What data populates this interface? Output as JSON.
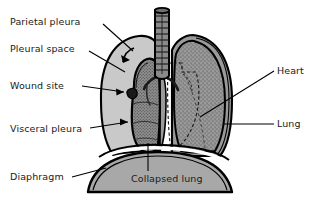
{
  "labels": {
    "parietal_pleura": "Parietal pleura",
    "pleural_space": "Pleural space",
    "wound_site": "Wound site",
    "visceral_pleura": "Visceral pleura",
    "diaphragm": "Diaphragm",
    "heart": "Heart",
    "lung": "Lung",
    "collapsed_lung": "Collapsed lung"
  },
  "colors": {
    "background": "#ffffff",
    "outline": "#000000",
    "pleural_space_fill": "#c9c9c9",
    "lung_fill": "#9a9a9a",
    "collapsed_lung_fill": "#8f8f8f",
    "diaphragm_fill": "#a8a8a8",
    "trachea_fill": "#8a8a8a",
    "text": "#1a1a1a"
  },
  "parts": [
    {
      "name": "trachea",
      "side": "center"
    },
    {
      "name": "right-lung-inflated",
      "side": "image-right"
    },
    {
      "name": "left-lung-collapsed",
      "side": "image-left"
    },
    {
      "name": "heart-outline",
      "style": "dashed"
    },
    {
      "name": "chest-wall",
      "side": "both"
    },
    {
      "name": "diaphragm",
      "side": "bottom"
    },
    {
      "name": "wound-arrow",
      "side": "image-left"
    }
  ]
}
